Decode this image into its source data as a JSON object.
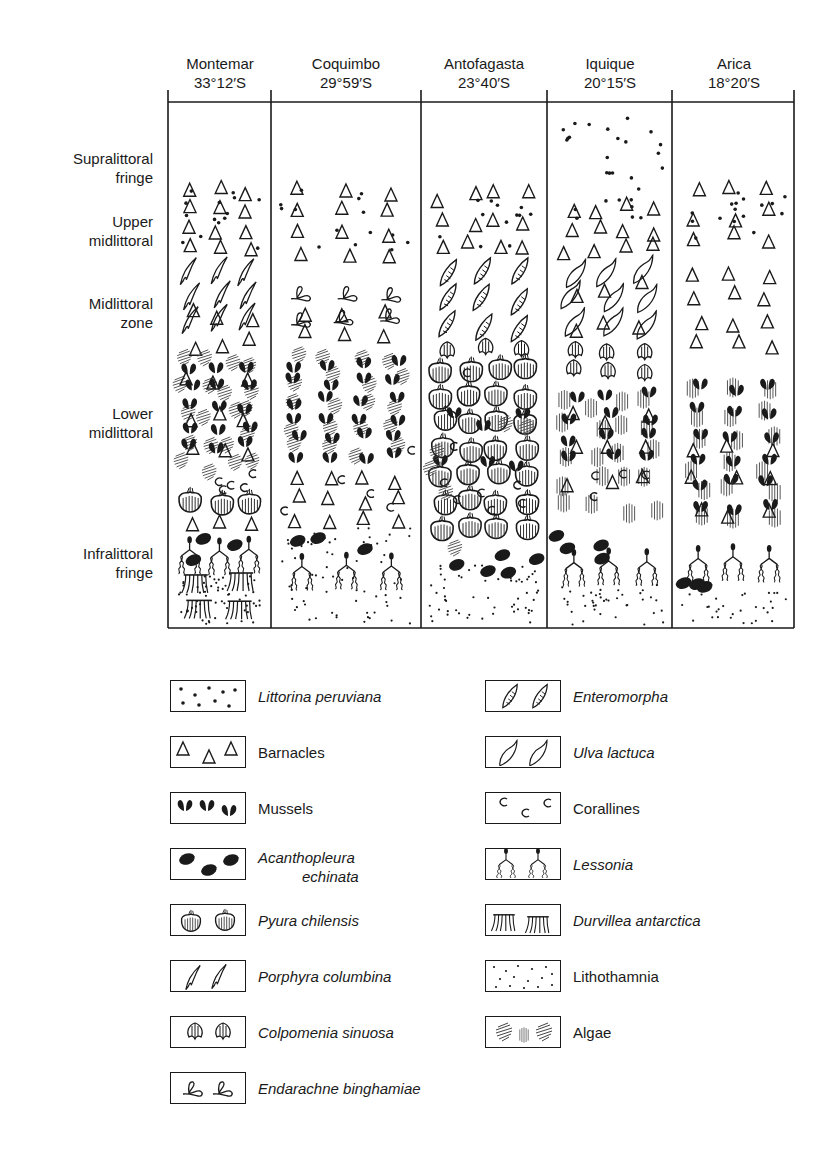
{
  "sites": [
    {
      "name": "Montemar",
      "latitude": "33°12′S"
    },
    {
      "name": "Coquimbo",
      "latitude": "29°59′S"
    },
    {
      "name": "Antofagasta",
      "latitude": "23°40′S"
    },
    {
      "name": "Iquique",
      "latitude": "20°15′S"
    },
    {
      "name": "Arica",
      "latitude": "18°20′S"
    }
  ],
  "zones": [
    {
      "line1": "Supralittoral",
      "line2": "fringe"
    },
    {
      "line1": "Upper",
      "line2": "midlittoral"
    },
    {
      "line1": "Midlittoral",
      "line2": "zone"
    },
    {
      "line1": "Lower",
      "line2": "midlittoral"
    },
    {
      "line1": "Infralittoral",
      "line2": "fringe"
    }
  ],
  "legend": [
    {
      "symbol": "littorina-dots",
      "label": "Littorina peruviana",
      "italic": true
    },
    {
      "symbol": "barnacle-triangle",
      "label": "Barnacles",
      "italic": false
    },
    {
      "symbol": "mussel",
      "label": "Mussels",
      "italic": false
    },
    {
      "symbol": "chiton-oval",
      "label": "Acanthopleura",
      "label2": "echinata",
      "italic": true
    },
    {
      "symbol": "pyura",
      "label": "Pyura chilensis",
      "italic": true
    },
    {
      "symbol": "porphyra",
      "label": "Porphyra columbina",
      "italic": true
    },
    {
      "symbol": "colpomenia",
      "label": "Colpomenia sinuosa",
      "italic": true
    },
    {
      "symbol": "endarachne",
      "label": "Endarachne binghamiae",
      "italic": true
    },
    {
      "symbol": "enteromorpha",
      "label": "Enteromorpha",
      "italic": true
    },
    {
      "symbol": "ulva",
      "label": "Ulva lactuca",
      "italic": true
    },
    {
      "symbol": "coralline",
      "label": "Corallines",
      "italic": false
    },
    {
      "symbol": "lessonia",
      "label": "Lessonia",
      "italic": true
    },
    {
      "symbol": "durvillea",
      "label": "Durvillea antarctica",
      "italic": true
    },
    {
      "symbol": "lithothamnia-stipple",
      "label": "Lithothamnia",
      "italic": false
    },
    {
      "symbol": "algae-hatch",
      "label": "Algae",
      "italic": false
    }
  ],
  "columns_content": [
    {
      "site": "Montemar",
      "bands": [
        "barnacles + littorina (upper)",
        "porphyra + barnacles (mid)",
        "mussels + algae + barnacles (lower)",
        "corallines + pyura",
        "lessonia + chitons",
        "durvillea + lithothamnia"
      ]
    },
    {
      "site": "Coquimbo",
      "bands": [
        "barnacles + littorina (upper)",
        "endarachne + barnacles (mid)",
        "mussels + algae (lower)",
        "barnacles + corallines",
        "lithothamnia + chitons + lessonia"
      ]
    },
    {
      "site": "Antofagasta",
      "bands": [
        "barnacles + littorina (upper)",
        "enteromorpha (mid)",
        "colpomenia",
        "pyura dense + mussels + corallines (lower)",
        "chitons + lithothamnia"
      ]
    },
    {
      "site": "Iquique",
      "bands": [
        "littorina (supralittoral)",
        "barnacles",
        "ulva + barnacles (mid)",
        "colpomenia",
        "mussels + algae + corallines (lower)",
        "lessonia + chitons",
        "lithothamnia"
      ]
    },
    {
      "site": "Arica",
      "bands": [
        "barnacles + littorina (upper)",
        "barnacles (mid)",
        "mussels + algae (lower)",
        "lessonia + chitons",
        "lithothamnia"
      ]
    }
  ],
  "layout": {
    "frame": {
      "left": 168,
      "top": 102,
      "right": 794,
      "bottom": 628
    },
    "dividers": [
      271,
      421,
      547,
      672
    ]
  }
}
